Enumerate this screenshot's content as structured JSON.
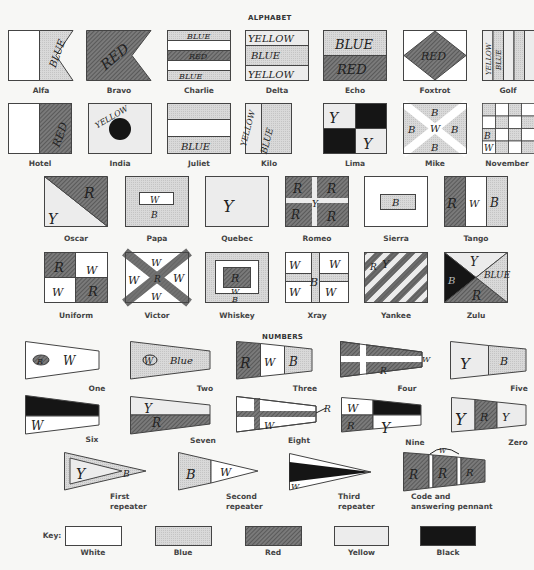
{
  "headings": {
    "alphabet": "ALPHABET",
    "numbers": "NUMBERS"
  },
  "colors": {
    "white": "#ffffff",
    "blue": "#d6d6d6",
    "red": "#6e6e6e",
    "yellow": "#ececec",
    "black": "#151515",
    "outline": "#444444"
  },
  "alphabet": [
    {
      "name": "Alfa",
      "marks": [
        "BLUE"
      ]
    },
    {
      "name": "Bravo",
      "marks": [
        "RED"
      ]
    },
    {
      "name": "Charlie",
      "marks": [
        "BLUE",
        "RED",
        "BLUE"
      ]
    },
    {
      "name": "Delta",
      "marks": [
        "YELLOW",
        "BLUE",
        "YELLOW"
      ]
    },
    {
      "name": "Echo",
      "marks": [
        "BLUE",
        "RED"
      ]
    },
    {
      "name": "Foxtrot",
      "marks": [
        "RED"
      ]
    },
    {
      "name": "Golf",
      "marks": [
        "YELLOW",
        "BLUE"
      ]
    },
    {
      "name": "Hotel",
      "marks": [
        "RED"
      ]
    },
    {
      "name": "India",
      "marks": [
        "YELLOW"
      ]
    },
    {
      "name": "Juliet",
      "marks": [
        "BLUE"
      ]
    },
    {
      "name": "Kilo",
      "marks": [
        "YELLOW",
        "BLUE"
      ]
    },
    {
      "name": "Lima",
      "marks": [
        "Y",
        "Y"
      ]
    },
    {
      "name": "Mike",
      "marks": [
        "B",
        "B",
        "W",
        "B",
        "B"
      ]
    },
    {
      "name": "November",
      "marks": [
        "B",
        "W"
      ]
    },
    {
      "name": "Oscar",
      "marks": [
        "R",
        "Y"
      ]
    },
    {
      "name": "Papa",
      "marks": [
        "W",
        "B"
      ]
    },
    {
      "name": "Quebec",
      "marks": [
        "Y"
      ]
    },
    {
      "name": "Romeo",
      "marks": [
        "R",
        "R",
        "Y",
        "R",
        "R"
      ]
    },
    {
      "name": "Sierra",
      "marks": [
        "B"
      ]
    },
    {
      "name": "Tango",
      "marks": [
        "R",
        "W",
        "B"
      ]
    },
    {
      "name": "Uniform",
      "marks": [
        "R",
        "W",
        "W",
        "R"
      ]
    },
    {
      "name": "Victor",
      "marks": [
        "W",
        "W",
        "R",
        "W",
        "W"
      ]
    },
    {
      "name": "Whiskey",
      "marks": [
        "R",
        "W",
        "B"
      ]
    },
    {
      "name": "Xray",
      "marks": [
        "W",
        "W",
        "B",
        "W",
        "W"
      ]
    },
    {
      "name": "Yankee",
      "marks": [
        "R",
        "Y"
      ]
    },
    {
      "name": "Zulu",
      "marks": [
        "Y",
        "B",
        "R",
        "BLUE"
      ]
    }
  ],
  "numbers": [
    {
      "name": "One",
      "marks": [
        "R",
        "W"
      ]
    },
    {
      "name": "Two",
      "marks": [
        "W",
        "Blue"
      ]
    },
    {
      "name": "Three",
      "marks": [
        "R",
        "W",
        "B"
      ]
    },
    {
      "name": "Four",
      "marks": [
        "R",
        "W"
      ]
    },
    {
      "name": "Five",
      "marks": [
        "Y",
        "B"
      ]
    },
    {
      "name": "Six",
      "marks": [
        "W"
      ]
    },
    {
      "name": "Seven",
      "marks": [
        "Y",
        "R"
      ]
    },
    {
      "name": "Eight",
      "marks": [
        "W",
        "R"
      ]
    },
    {
      "name": "Nine",
      "marks": [
        "W",
        "R",
        "Y"
      ]
    },
    {
      "name": "Zero",
      "marks": [
        "Y",
        "R",
        "Y"
      ]
    }
  ],
  "repeaters": [
    {
      "name_line1": "First",
      "name_line2": "repeater",
      "marks": [
        "Y",
        "B"
      ]
    },
    {
      "name_line1": "Second",
      "name_line2": "repeater",
      "marks": [
        "B",
        "W"
      ]
    },
    {
      "name_line1": "Third",
      "name_line2": "repeater",
      "marks": [
        "W"
      ]
    },
    {
      "name_line1": "Code and",
      "name_line2": "answering pennant",
      "marks": [
        "R",
        "W",
        "R",
        "R"
      ]
    }
  ],
  "key": {
    "label": "Key:",
    "items": [
      {
        "name": "White"
      },
      {
        "name": "Blue"
      },
      {
        "name": "Red"
      },
      {
        "name": "Yellow"
      },
      {
        "name": "Black"
      }
    ]
  }
}
